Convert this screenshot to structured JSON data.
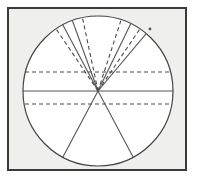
{
  "figure": {
    "title": "Circle with radiating chords and horizontal chords",
    "type": "geometric-diagram",
    "canvas": {
      "width": 201,
      "height": 180
    },
    "colors": {
      "page_background": "#ffffff",
      "panel_fill": "#efefed",
      "panel_border": "#3a3a3a",
      "circle_interior": "#ffffff",
      "circle_stroke": "#444444",
      "solid_line": "#555555",
      "dashed_line": "#4a4a4a",
      "dot": "#555555"
    },
    "panel": {
      "x": 8,
      "y": 8,
      "width": 178,
      "height": 162,
      "border_width": 2
    },
    "circle": {
      "center_x": 98,
      "center_y": 91,
      "radius": 75,
      "stroke_width": 1.2
    },
    "center_point": {
      "x": 98,
      "y": 91,
      "label": "center"
    },
    "radial_lines": [
      {
        "name": "upper-left-solid-outer",
        "style": "solid",
        "angle_deg": 118,
        "from": "center",
        "to": "circumference"
      },
      {
        "name": "upper-left-dashed-outer",
        "style": "dashed",
        "angle_deg": 124,
        "from": "center",
        "to": "circumference"
      },
      {
        "name": "upper-left-solid-inner",
        "style": "solid",
        "angle_deg": 110,
        "from": "center",
        "to": "circumference"
      },
      {
        "name": "upper-left-dashed-inner",
        "style": "dashed",
        "angle_deg": 102,
        "from": "center",
        "to": "circumference"
      },
      {
        "name": "upper-right-dashed-inner",
        "style": "dashed",
        "angle_deg": 72,
        "from": "center",
        "to": "circumference"
      },
      {
        "name": "upper-right-solid-inner",
        "style": "solid",
        "angle_deg": 64,
        "from": "center",
        "to": "circumference"
      },
      {
        "name": "upper-right-dashed-outer",
        "style": "dashed",
        "angle_deg": 56,
        "from": "center",
        "to": "circumference"
      },
      {
        "name": "upper-right-solid-outer",
        "style": "solid",
        "angle_deg": 50,
        "from": "center",
        "to": "circumference"
      },
      {
        "name": "lower-left-solid",
        "style": "solid",
        "angle_deg": 242,
        "from": "center",
        "to": "circumference"
      },
      {
        "name": "lower-right-solid",
        "style": "solid",
        "angle_deg": 298,
        "from": "center",
        "to": "circumference"
      }
    ],
    "horizontal_lines": [
      {
        "name": "upper-horizontal-chord",
        "style": "dashed",
        "y": 72
      },
      {
        "name": "center-horizontal-diameter",
        "style": "solid",
        "y": 91
      },
      {
        "name": "lower-horizontal-chord",
        "style": "dashed",
        "y": 104
      }
    ],
    "markers": [
      {
        "name": "upper-right-dot",
        "x": 150,
        "y": 29,
        "radius": 1.4
      }
    ]
  }
}
